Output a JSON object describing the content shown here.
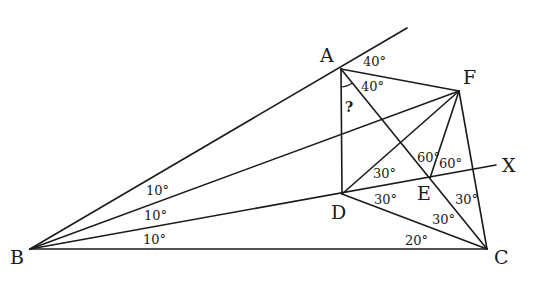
{
  "diagram": {
    "points": {
      "A": {
        "label": "A",
        "x": 341,
        "y": 69
      },
      "B": {
        "label": "B",
        "x": 30,
        "y": 249
      },
      "C": {
        "label": "C",
        "x": 487,
        "y": 249
      },
      "D": {
        "label": "D",
        "x": 342,
        "y": 194
      },
      "E": {
        "label": "E",
        "x": 430,
        "y": 178
      },
      "F": {
        "label": "F",
        "x": 459,
        "y": 91
      },
      "X": {
        "label": "X",
        "x": 496,
        "y": 165
      }
    },
    "angle_labels": {
      "a_ext_40": "40°",
      "a_fac_40": "40°",
      "unknown": "?",
      "b_top_10": "10°",
      "b_mid_10": "10°",
      "b_low_10": "10°",
      "d_upper_30": "30°",
      "d_lower_30": "30°",
      "e_left_60": "60°",
      "e_right_60": "60°",
      "c_fc_30": "30°",
      "c_dc_30": "30°",
      "c_bc_20": "20°"
    },
    "segments": [
      [
        "B",
        "A_ext"
      ],
      [
        "B",
        "F"
      ],
      [
        "B",
        "X"
      ],
      [
        "B",
        "C"
      ],
      [
        "A",
        "F"
      ],
      [
        "A",
        "D"
      ],
      [
        "A",
        "C"
      ],
      [
        "F",
        "D"
      ],
      [
        "F",
        "E"
      ],
      [
        "F",
        "C"
      ],
      [
        "D",
        "C"
      ]
    ]
  }
}
